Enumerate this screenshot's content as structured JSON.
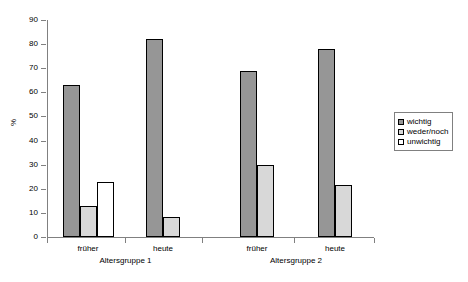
{
  "chart_data": {
    "type": "bar",
    "title": "",
    "subtitle": "",
    "xlabel": "",
    "ylabel": "%",
    "ylim": [
      0,
      90
    ],
    "ytick_step": 10,
    "yticks": [
      "0",
      "10",
      "20",
      "30",
      "40",
      "50",
      "60",
      "70",
      "80",
      "90"
    ],
    "grid": false,
    "legend_position": "right",
    "groups": [
      {
        "name": "Altersgruppe 1",
        "categories": [
          "früher",
          "heute"
        ]
      },
      {
        "name": "Altersgruppe 2",
        "categories": [
          "früher",
          "heute"
        ]
      }
    ],
    "categories": [
      "früher",
      "heute",
      "früher",
      "heute"
    ],
    "group_labels": [
      "Altersgruppe 1",
      "Altersgruppe 2"
    ],
    "series": [
      {
        "name": "wichtig",
        "color": "#969696",
        "values": [
          63,
          82,
          69,
          78
        ]
      },
      {
        "name": "weder/noch",
        "color": "#d8d8d8",
        "values": [
          13,
          8.5,
          30,
          21.5
        ]
      },
      {
        "name": "unwichtig",
        "color": "#ffffff",
        "values": [
          23,
          0,
          0,
          0
        ]
      }
    ],
    "bars": [
      {
        "series": "wichtig",
        "group": "Altersgruppe 1",
        "category": "früher",
        "value": 63
      },
      {
        "series": "weder/noch",
        "group": "Altersgruppe 1",
        "category": "früher",
        "value": 13
      },
      {
        "series": "unwichtig",
        "group": "Altersgruppe 1",
        "category": "früher",
        "value": 23
      },
      {
        "series": "wichtig",
        "group": "Altersgruppe 1",
        "category": "heute",
        "value": 82
      },
      {
        "series": "weder/noch",
        "group": "Altersgruppe 1",
        "category": "heute",
        "value": 8.5
      },
      {
        "series": "wichtig",
        "group": "Altersgruppe 2",
        "category": "früher",
        "value": 69
      },
      {
        "series": "weder/noch",
        "group": "Altersgruppe 2",
        "category": "früher",
        "value": 30
      },
      {
        "series": "wichtig",
        "group": "Altersgruppe 2",
        "category": "heute",
        "value": 78
      },
      {
        "series": "weder/noch",
        "group": "Altersgruppe 2",
        "category": "heute",
        "value": 21.5
      }
    ]
  },
  "axis": {
    "y_title": "%",
    "y_labels": [
      "90",
      "80",
      "70",
      "60",
      "50",
      "40",
      "30",
      "20",
      "10",
      "0"
    ]
  },
  "legend": {
    "items": [
      {
        "label": "wichtig",
        "color": "#969696"
      },
      {
        "label": "weder/noch",
        "color": "#d8d8d8"
      },
      {
        "label": "unwichtig",
        "color": "#ffffff"
      }
    ]
  },
  "xaxis": {
    "category_labels": [
      "früher",
      "heute",
      "früher",
      "heute"
    ],
    "group_labels": [
      "Altersgruppe 1",
      "Altersgruppe 2"
    ]
  }
}
